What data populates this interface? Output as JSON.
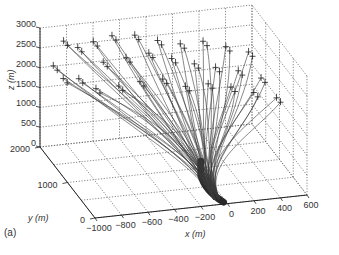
{
  "chart_data": {
    "type": "line",
    "projection": "3d",
    "title": "",
    "panel_label": "(a)",
    "xlabel": "x (m)",
    "ylabel": "y (m)",
    "zlabel": "z (m)",
    "xlim": [
      -1000,
      600
    ],
    "ylim": [
      0,
      2000
    ],
    "zlim": [
      0,
      3000
    ],
    "x_ticks": [
      -1000,
      -800,
      -600,
      -400,
      -200,
      0,
      200,
      400,
      600
    ],
    "y_ticks": [
      0,
      1000,
      2000
    ],
    "z_ticks": [
      0,
      500,
      1000,
      1500,
      2000,
      2500,
      3000
    ],
    "grid": true,
    "legend": null,
    "series_description": "Bundle of ~60 particle trajectories rising from a narrow trunk near x≈-100 m, y≈0–300 m, z≈0 and fanning out upward; each trajectory ends at a '+' marker near z≈1800–2900 m",
    "trunk": {
      "x": -100,
      "y": 150,
      "z_start": 0,
      "z_end": 900
    },
    "endpoints": [
      {
        "x": -950,
        "y": 1700,
        "z": 2300
      },
      {
        "x": -900,
        "y": 1600,
        "z": 2050
      },
      {
        "x": -850,
        "y": 1850,
        "z": 2750
      },
      {
        "x": -800,
        "y": 1500,
        "z": 2100
      },
      {
        "x": -750,
        "y": 1800,
        "z": 2600
      },
      {
        "x": -700,
        "y": 1400,
        "z": 1900
      },
      {
        "x": -650,
        "y": 1700,
        "z": 2800
      },
      {
        "x": -600,
        "y": 1600,
        "z": 2350
      },
      {
        "x": -550,
        "y": 1300,
        "z": 2000
      },
      {
        "x": -500,
        "y": 1750,
        "z": 2850
      },
      {
        "x": -450,
        "y": 1500,
        "z": 2500
      },
      {
        "x": -400,
        "y": 1200,
        "z": 2150
      },
      {
        "x": -350,
        "y": 1650,
        "z": 2900
      },
      {
        "x": -300,
        "y": 1400,
        "z": 2650
      },
      {
        "x": -250,
        "y": 1100,
        "z": 2250
      },
      {
        "x": -200,
        "y": 1550,
        "z": 2800
      },
      {
        "x": -150,
        "y": 1300,
        "z": 2550
      },
      {
        "x": -100,
        "y": 1000,
        "z": 2100
      },
      {
        "x": -50,
        "y": 1450,
        "z": 2750
      },
      {
        "x": 0,
        "y": 1200,
        "z": 2450
      },
      {
        "x": 50,
        "y": 900,
        "z": 2200
      },
      {
        "x": 100,
        "y": 1350,
        "z": 2850
      },
      {
        "x": 150,
        "y": 1100,
        "z": 2400
      },
      {
        "x": 200,
        "y": 800,
        "z": 2150
      },
      {
        "x": 250,
        "y": 1250,
        "z": 2750
      },
      {
        "x": 300,
        "y": 1000,
        "z": 2350
      },
      {
        "x": 350,
        "y": 700,
        "z": 2050
      },
      {
        "x": 400,
        "y": 1150,
        "z": 2650
      },
      {
        "x": 450,
        "y": 900,
        "z": 2200
      },
      {
        "x": 500,
        "y": 600,
        "z": 1950
      }
    ]
  },
  "axes": {
    "x_label": "x (m)",
    "y_label": "y (m)",
    "z_label": "z (m)",
    "x_tick_labels": [
      "−1000",
      "−800",
      "−600",
      "−400",
      "−200",
      "0",
      "200",
      "400",
      "600"
    ],
    "y_tick_labels": [
      "0",
      "1000",
      "2000"
    ],
    "z_tick_labels": [
      "0",
      "500",
      "1000",
      "1500",
      "2000",
      "2500",
      "3000"
    ]
  },
  "panel_label": "(a)",
  "colors": {
    "trajectory": "#3a3a3a",
    "grid": "#555555",
    "axis": "#222222",
    "trunk": "#2a2a2a"
  }
}
